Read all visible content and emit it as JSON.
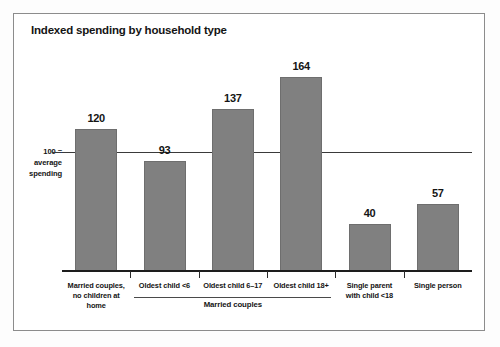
{
  "figure": {
    "title": "Indexed spending by household type",
    "axis_note_lines": [
      "100 =",
      "average",
      "spending"
    ],
    "group_bracket_label": "Married couples",
    "bar_color": "#808080",
    "text_color": "#141414",
    "frame_color": "#8c8c8c",
    "background": "#ffffff"
  },
  "chart_data": {
    "type": "bar",
    "title": "Indexed spending by household type",
    "xlabel": "",
    "ylabel": "",
    "ylim": [
      0,
      180
    ],
    "grid": false,
    "legend": "none",
    "reference_line": {
      "value": 100,
      "label": "100 = average spending"
    },
    "categories": [
      "Married couples, no children at home",
      "Oldest child <6",
      "Oldest child 6–17",
      "Oldest child 18+",
      "Single parent with child <18",
      "Single person"
    ],
    "category_label_lines": [
      [
        "Married couples,",
        "no children at home"
      ],
      [
        "Oldest child <6"
      ],
      [
        "Oldest child 6–17"
      ],
      [
        "Oldest child 18+"
      ],
      [
        "Single parent",
        "with child <18"
      ],
      [
        "Single person"
      ]
    ],
    "values": [
      120,
      93,
      137,
      164,
      40,
      57
    ],
    "value_labels": [
      "120",
      "93",
      "137",
      "164",
      "40",
      "57"
    ],
    "groups": [
      {
        "label": "Married couples",
        "categories": [
          "Oldest child <6",
          "Oldest child 6–17",
          "Oldest child 18+"
        ]
      }
    ]
  }
}
